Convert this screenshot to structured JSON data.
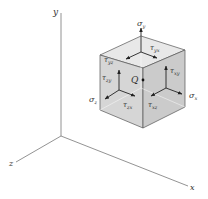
{
  "axes": {
    "x_label": "x",
    "y_label": "y",
    "z_label": "z"
  },
  "point": {
    "label": "Q"
  },
  "stresses": {
    "sigma_y": {
      "sym": "σ",
      "sub": "y"
    },
    "sigma_x": {
      "sym": "σ",
      "sub": "x"
    },
    "sigma_z": {
      "sym": "σ",
      "sub": "z"
    },
    "tau_yx": {
      "sym": "τ",
      "sub": "yx"
    },
    "tau_yz": {
      "sym": "τ",
      "sub": "yz"
    },
    "tau_xy": {
      "sym": "τ",
      "sub": "xy"
    },
    "tau_zy": {
      "sym": "τ",
      "sub": "zy"
    },
    "tau_zx": {
      "sym": "τ",
      "sub": "zx"
    },
    "tau_xz": {
      "sym": "τ",
      "sub": "xz"
    }
  },
  "colors": {
    "face_top": "#e6e6e6",
    "face_left": "#d4d4d4",
    "face_right": "#cacaca",
    "edge": "#555555",
    "arrow": "#222222"
  }
}
